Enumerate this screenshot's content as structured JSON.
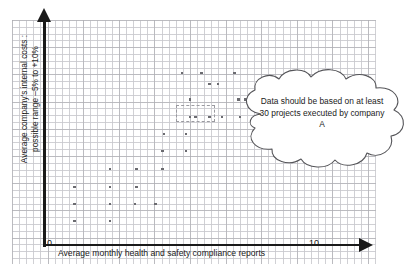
{
  "chart_data": {
    "type": "scatter",
    "title": "",
    "xlabel": "Average monthly health and safety compliance reports",
    "ylabel": "Average company's internal costs :\npossible range –5% to +10%",
    "xlim": [
      0,
      10
    ],
    "ylim": [
      -5,
      10
    ],
    "xticks": [
      "0",
      "10"
    ],
    "yticks": [],
    "grid": true,
    "legend": null,
    "annotations": [
      {
        "kind": "cloud-callout",
        "text": "Data should be based on at least 30 projects executed by company A"
      },
      {
        "kind": "selection-rectangle",
        "style": "dashed"
      }
    ],
    "points": [
      {
        "x": 1.05,
        "y": 1.55
      },
      {
        "x": 1.05,
        "y": 0.5
      },
      {
        "x": 2.35,
        "y": 2.6
      },
      {
        "x": 2.35,
        "y": 1.55
      },
      {
        "x": 2.35,
        "y": 0.5
      },
      {
        "x": 2.35,
        "y": 3.7
      },
      {
        "x": 3.3,
        "y": 2.6
      },
      {
        "x": 3.3,
        "y": 3.7
      },
      {
        "x": 4.25,
        "y": 3.7
      },
      {
        "x": 4.25,
        "y": 4.8
      },
      {
        "x": 4.3,
        "y": 5.85
      },
      {
        "x": 5.1,
        "y": 5.85
      },
      {
        "x": 5.1,
        "y": 4.8
      },
      {
        "x": 5.25,
        "y": 6.9
      },
      {
        "x": 5.25,
        "y": 7.95
      },
      {
        "x": 5.95,
        "y": 8.9
      },
      {
        "x": 6.25,
        "y": 8.9
      },
      {
        "x": 4.95,
        "y": 9.55
      },
      {
        "x": 5.65,
        "y": 9.55
      },
      {
        "x": 6.4,
        "y": 6.9
      },
      {
        "x": 5.45,
        "y": 6.9
      },
      {
        "x": 5.95,
        "y": 6.9
      },
      {
        "x": 7.05,
        "y": 6.9
      },
      {
        "x": 7.0,
        "y": 7.95
      },
      {
        "x": 7.25,
        "y": 7.95
      },
      {
        "x": 6.85,
        "y": 9.55
      },
      {
        "x": 3.25,
        "y": 1.55
      },
      {
        "x": 4.0,
        "y": 1.55
      },
      {
        "x": 1.05,
        "y": 2.6
      }
    ]
  },
  "figure": {
    "axis_zero_label": "0",
    "axis_max_label": "10",
    "x_axis_title": "Average monthly health and safety compliance reports",
    "y_axis_title": "Average company's internal costs :\npossible range –5% to +10%",
    "callout_text": "Data should be based on at least 30 projects executed by company A",
    "colors": {
      "axis": "#1a1a1a",
      "point": "#6b6b70",
      "grid_major": "#aaaaaf",
      "grid_minor": "#c8c8cd",
      "cloud_stroke": "#555559",
      "background": "#ffffff"
    }
  }
}
